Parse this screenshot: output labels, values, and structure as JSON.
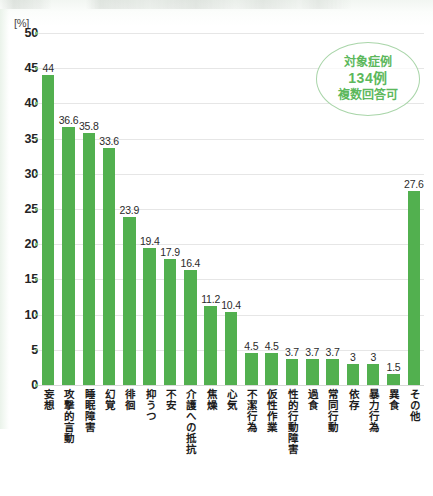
{
  "unit_label": "[%]",
  "annotation": {
    "line1": "対象症例",
    "line2": "134例",
    "line3": "複数回答可"
  },
  "colors": {
    "bar": "#52b04f",
    "annotation_text": "#5cb85c",
    "gridline": "#e6e6e6",
    "tick_dot": "#7fbf7f"
  },
  "chart_data": {
    "type": "bar",
    "title": "",
    "subtitle": "",
    "xlabel": "",
    "ylabel": "[%]",
    "ylim": [
      0,
      50
    ],
    "yticks": [
      0,
      5,
      10,
      15,
      20,
      25,
      30,
      35,
      40,
      45,
      50
    ],
    "ytick_labels": [
      "0",
      "5",
      "10",
      "15",
      "20",
      "25",
      "30",
      "35",
      "40",
      "45",
      "50"
    ],
    "grid": true,
    "legend": false,
    "categories": [
      "妄想",
      "攻撃的言動",
      "睡眠障害",
      "幻覚",
      "徘徊",
      "抑うつ",
      "不安",
      "介護への抵抗",
      "焦燥",
      "心気",
      "不潔行為",
      "仮性作業",
      "性的行動障害",
      "過食",
      "常同行動",
      "依存",
      "暴力行為",
      "異食",
      "その他"
    ],
    "values": [
      44,
      36.6,
      35.8,
      33.6,
      23.9,
      19.4,
      17.9,
      16.4,
      11.2,
      10.4,
      4.5,
      4.5,
      3.7,
      3.7,
      3.7,
      3,
      3,
      1.5,
      27.6
    ],
    "value_labels": [
      "44",
      "36.6",
      "35.8",
      "33.6",
      "23.9",
      "19.4",
      "17.9",
      "16.4",
      "11.2",
      "10.4",
      "4.5",
      "4.5",
      "3.7",
      "3.7",
      "3.7",
      "3",
      "3",
      "1.5",
      "27.6"
    ],
    "annotations": [
      "対象症例",
      "134例",
      "複数回答可"
    ]
  }
}
